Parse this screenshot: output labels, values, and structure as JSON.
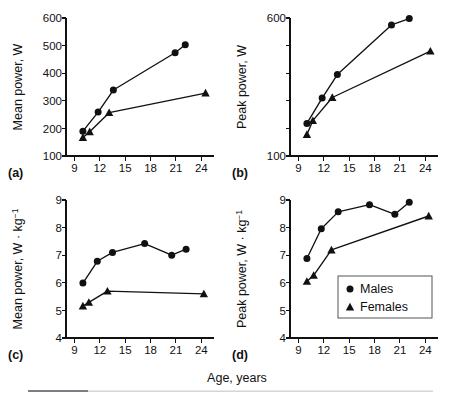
{
  "figure": {
    "xlabel": "Age, years",
    "legend": {
      "position": "inside-panel-d-lower-right",
      "entries": [
        {
          "label": "Males",
          "marker": "circle-marker-icon"
        },
        {
          "label": "Females",
          "marker": "triangle-marker-icon"
        }
      ]
    },
    "panel_labels": [
      "(a)",
      "(b)",
      "(c)",
      "(d)"
    ]
  },
  "chart_data": [
    {
      "id": "panel-a",
      "panel": "(a)",
      "type": "line",
      "title": "",
      "xlabel": "Age, years",
      "ylabel": "Mean power, W",
      "xlim": [
        8.0,
        25.5
      ],
      "ylim": [
        100,
        600
      ],
      "xticks": [
        9,
        12,
        15,
        18,
        21,
        24
      ],
      "yticks": [
        100,
        200,
        300,
        400,
        500,
        600
      ],
      "ytick_labels": [
        "100",
        "200",
        "300",
        "400",
        "500",
        "600"
      ],
      "grid": false,
      "series": [
        {
          "name": "Males",
          "marker": "circle",
          "x": [
            10.0,
            11.8,
            13.6,
            20.9,
            22.1
          ],
          "values": [
            190,
            259,
            339,
            474,
            503
          ]
        },
        {
          "name": "Females",
          "marker": "triangle",
          "x": [
            10.0,
            10.8,
            13.1,
            24.5
          ],
          "values": [
            167,
            188,
            257,
            328
          ]
        }
      ]
    },
    {
      "id": "panel-b",
      "panel": "(b)",
      "type": "line",
      "title": "",
      "xlabel": "Age, years",
      "ylabel": "Peak power, W",
      "xlim": [
        8.0,
        25.5
      ],
      "ylim": [
        100,
        600
      ],
      "xticks": [
        9,
        12,
        15,
        18,
        21,
        24
      ],
      "yticks": [
        100,
        200,
        300,
        400,
        500,
        600
      ],
      "ytick_labels": [
        "100",
        "",
        "",
        "",
        "",
        "600"
      ],
      "grid": false,
      "series": [
        {
          "name": "Males",
          "marker": "circle",
          "x": [
            10.0,
            11.8,
            13.6,
            20.0,
            22.1
          ],
          "values": [
            218,
            310,
            395,
            575,
            598
          ]
        },
        {
          "name": "Females",
          "marker": "triangle",
          "x": [
            10.0,
            10.7,
            13.0,
            24.6
          ],
          "values": [
            178,
            228,
            312,
            480
          ]
        }
      ]
    },
    {
      "id": "panel-c",
      "panel": "(c)",
      "type": "line",
      "title": "",
      "xlabel": "Age, years",
      "ylabel": "Mean power, W · kg⁻¹",
      "xlim": [
        8.0,
        25.5
      ],
      "ylim": [
        4,
        9
      ],
      "xticks": [
        9,
        12,
        15,
        18,
        21,
        24
      ],
      "yticks": [
        4,
        5,
        6,
        7,
        8,
        9
      ],
      "ytick_labels": [
        "4",
        "5",
        "6",
        "7",
        "8",
        "9"
      ],
      "grid": false,
      "series": [
        {
          "name": "Males",
          "marker": "circle",
          "x": [
            10.0,
            11.7,
            13.5,
            17.3,
            20.5,
            22.2
          ],
          "values": [
            5.99,
            6.78,
            7.1,
            7.42,
            7.0,
            7.22
          ]
        },
        {
          "name": "Females",
          "marker": "triangle",
          "x": [
            10.0,
            10.7,
            12.9,
            24.3
          ],
          "values": [
            5.16,
            5.29,
            5.7,
            5.6
          ]
        }
      ]
    },
    {
      "id": "panel-d",
      "panel": "(d)",
      "type": "line",
      "title": "",
      "xlabel": "Age, years",
      "ylabel": "Peak power, W · kg⁻¹",
      "xlim": [
        8.0,
        25.5
      ],
      "ylim": [
        4,
        9
      ],
      "xticks": [
        9,
        12,
        15,
        18,
        21,
        24
      ],
      "yticks": [
        4,
        5,
        6,
        7,
        8,
        9
      ],
      "ytick_labels": [
        "4",
        "5",
        "6",
        "7",
        "8",
        "9"
      ],
      "grid": false,
      "series": [
        {
          "name": "Males",
          "marker": "circle",
          "x": [
            10.0,
            11.7,
            13.7,
            17.4,
            20.4,
            22.1
          ],
          "values": [
            6.88,
            7.96,
            8.57,
            8.83,
            8.48,
            8.92
          ]
        },
        {
          "name": "Females",
          "marker": "triangle",
          "x": [
            10.0,
            10.8,
            12.9,
            24.4
          ],
          "values": [
            6.05,
            6.27,
            7.19,
            8.42
          ]
        }
      ]
    }
  ]
}
